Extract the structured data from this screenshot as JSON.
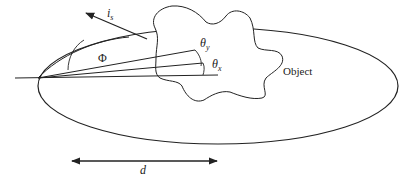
{
  "diagram": {
    "labels": {
      "incident_dir": "i",
      "incident_sub": "s",
      "phi": "Φ",
      "theta_y": "θ",
      "theta_y_sub": "y",
      "theta_x": "θ",
      "theta_x_sub": "x",
      "object": "Object",
      "distance": "d"
    },
    "colors": {
      "stroke": "#222222",
      "background": "#ffffff"
    }
  }
}
